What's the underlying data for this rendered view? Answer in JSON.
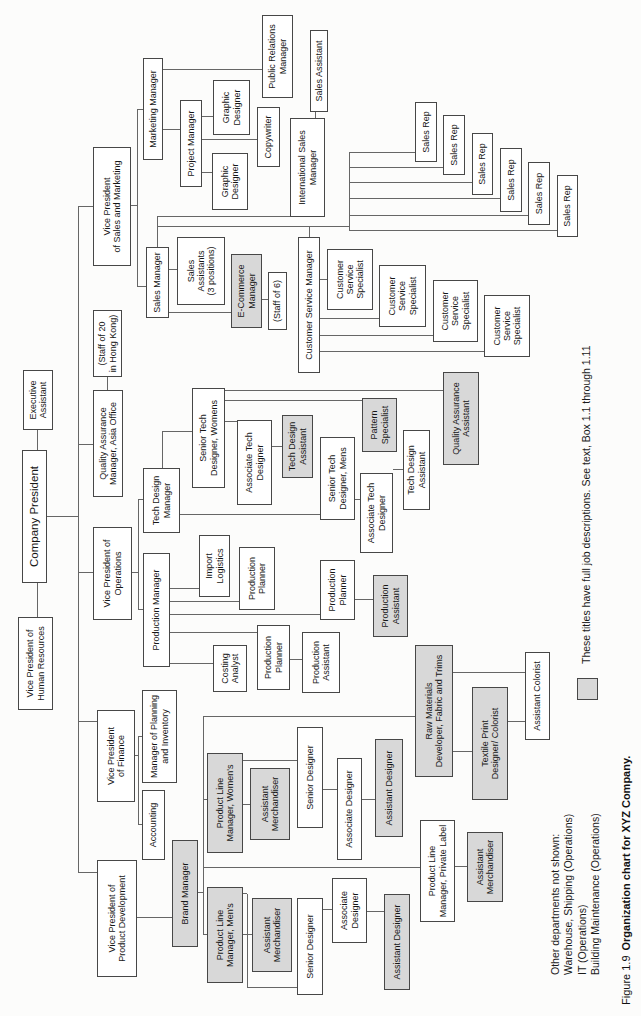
{
  "figure": {
    "caption_prefix": "Figure 1.9",
    "caption_title": "Organization chart for XYZ Company.",
    "legend": "These titles have full job descriptions. See text, Box 1.1 through 1.11",
    "notes": [
      "Other departments not shown:",
      "Warehouse, Shipping (Operations)",
      "IT (Operations)",
      "Building Maintenance (Operations)"
    ]
  },
  "colors": {
    "shaded_fill": "#d8d8d8",
    "box_border": "#474747",
    "connector": "#666666",
    "background": "#fcfcfb",
    "text": "#161616"
  },
  "nodes": [
    {
      "id": "vp-human-resources",
      "label": "Vice President of\nHuman Resources",
      "x": 306,
      "y": 18,
      "w": 93,
      "h": 35
    },
    {
      "id": "company-president",
      "label": "Company President",
      "x": 433,
      "y": 22,
      "w": 133,
      "h": 25,
      "big": true
    },
    {
      "id": "executive-assistant",
      "label": "Executive\nAssistant",
      "x": 586,
      "y": 23,
      "w": 60,
      "h": 30
    },
    {
      "id": "vp-product-development",
      "label": "Vice President of\nProduct Development",
      "x": 39,
      "y": 97,
      "w": 117,
      "h": 40
    },
    {
      "id": "vp-finance",
      "label": "Vice President\nof Finance",
      "x": 214,
      "y": 97,
      "w": 92,
      "h": 38
    },
    {
      "id": "vp-operations",
      "label": "Vice President of\nOperations",
      "x": 396,
      "y": 93,
      "w": 93,
      "h": 39
    },
    {
      "id": "qa-manager-asia-office",
      "label": "Quality Assurance\nManager, Asia Office",
      "x": 519,
      "y": 93,
      "w": 107,
      "h": 30
    },
    {
      "id": "staff-of-20",
      "label": "(Staff of 20\nin Hong Kong)",
      "x": 639,
      "y": 93,
      "w": 67,
      "h": 29
    },
    {
      "id": "vp-sales-marketing",
      "label": "Vice President\nof Sales and Marketing",
      "x": 750,
      "y": 93,
      "w": 119,
      "h": 38
    },
    {
      "id": "marketing-manager",
      "label": "Marketing Manager",
      "x": 856,
      "y": 143,
      "w": 102,
      "h": 20
    },
    {
      "id": "project-manager",
      "label": "Project Manager",
      "x": 829,
      "y": 180,
      "w": 87,
      "h": 22
    },
    {
      "id": "graphic-designer-1",
      "label": "Graphic\nDesigner",
      "x": 806,
      "y": 212,
      "w": 57,
      "h": 36
    },
    {
      "id": "graphic-designer-2",
      "label": "Graphic\nDesigner",
      "x": 881,
      "y": 213,
      "w": 55,
      "h": 37
    },
    {
      "id": "copywriter",
      "label": "Copywriter",
      "x": 849,
      "y": 257,
      "w": 60,
      "h": 23
    },
    {
      "id": "public-relations-manager",
      "label": "Public Relations\nManager",
      "x": 918,
      "y": 262,
      "w": 83,
      "h": 31
    },
    {
      "id": "sales-manager",
      "label": "Sales Manager",
      "x": 698,
      "y": 146,
      "w": 71,
      "h": 23
    },
    {
      "id": "sales-assistants",
      "label": "Sales\nAssistants\n(3 positions)",
      "x": 711,
      "y": 177,
      "w": 68,
      "h": 48
    },
    {
      "id": "e-commerce-manager",
      "label": "E-Commerce\nManager",
      "x": 688,
      "y": 231,
      "w": 74,
      "h": 31,
      "shaded": true
    },
    {
      "id": "staff-of-6",
      "label": "(Staff of 6)",
      "x": 686,
      "y": 268,
      "w": 58,
      "h": 19
    },
    {
      "id": "international-sales-manager",
      "label": "International Sales\nManager",
      "x": 799,
      "y": 290,
      "w": 99,
      "h": 35
    },
    {
      "id": "sales-assistant",
      "label": "Sales Assistant",
      "x": 904,
      "y": 310,
      "w": 82,
      "h": 18
    },
    {
      "id": "customer-service-manager",
      "label": "Customer Service Manager",
      "x": 643,
      "y": 298,
      "w": 136,
      "h": 22
    },
    {
      "id": "customer-service-specialist-1",
      "label": "Customer\nService\nSpecialist",
      "x": 706,
      "y": 327,
      "w": 61,
      "h": 46
    },
    {
      "id": "customer-service-specialist-2",
      "label": "Customer\nService\nSpecialist",
      "x": 689,
      "y": 379,
      "w": 62,
      "h": 47
    },
    {
      "id": "customer-service-specialist-3",
      "label": "Customer\nService\nSpecialist",
      "x": 674,
      "y": 433,
      "w": 62,
      "h": 45
    },
    {
      "id": "customer-service-specialist-4",
      "label": "Customer\nService\nSpecialist",
      "x": 659,
      "y": 484,
      "w": 62,
      "h": 46
    },
    {
      "id": "sales-rep-1",
      "label": "Sales Rep",
      "x": 854,
      "y": 415,
      "w": 60,
      "h": 22
    },
    {
      "id": "sales-rep-2",
      "label": "Sales Rep",
      "x": 841,
      "y": 443,
      "w": 60,
      "h": 22
    },
    {
      "id": "sales-rep-3",
      "label": "Sales Rep",
      "x": 821,
      "y": 472,
      "w": 62,
      "h": 21
    },
    {
      "id": "sales-rep-4",
      "label": "Sales Rep",
      "x": 804,
      "y": 500,
      "w": 64,
      "h": 22
    },
    {
      "id": "sales-rep-5",
      "label": "Sales Rep",
      "x": 791,
      "y": 528,
      "w": 63,
      "h": 22
    },
    {
      "id": "sales-rep-6",
      "label": "Sales Rep",
      "x": 779,
      "y": 557,
      "w": 62,
      "h": 21
    },
    {
      "id": "tech-design-manager",
      "label": "Tech Design\nManager",
      "x": 483,
      "y": 143,
      "w": 65,
      "h": 37
    },
    {
      "id": "senior-tech-designer-womens",
      "label": "Senior Tech\nDesigner, Womens",
      "x": 528,
      "y": 192,
      "w": 100,
      "h": 33
    },
    {
      "id": "associate-tech-designer-1",
      "label": "Associate Tech\nDesigner",
      "x": 511,
      "y": 237,
      "w": 85,
      "h": 35
    },
    {
      "id": "tech-design-assistant-1",
      "label": "Tech Design\nAssistant",
      "x": 538,
      "y": 282,
      "w": 63,
      "h": 31,
      "shaded": true
    },
    {
      "id": "senior-tech-designer-mens",
      "label": "Senior Tech\nDesigner, Mens",
      "x": 496,
      "y": 320,
      "w": 83,
      "h": 35
    },
    {
      "id": "associate-tech-designer-2",
      "label": "Associate Tech\nDesigner",
      "x": 463,
      "y": 360,
      "w": 80,
      "h": 33
    },
    {
      "id": "tech-design-assistant-2",
      "label": "Tech Design\nAssistant",
      "x": 506,
      "y": 403,
      "w": 80,
      "h": 27
    },
    {
      "id": "pattern-specialist",
      "label": "Pattern\nSpecialist",
      "x": 564,
      "y": 362,
      "w": 54,
      "h": 35,
      "shaded": true
    },
    {
      "id": "quality-assurance-assistant",
      "label": "Quality Assurance\nAssistant",
      "x": 551,
      "y": 443,
      "w": 93,
      "h": 36,
      "shaded": true
    },
    {
      "id": "production-manager",
      "label": "Production Manager",
      "x": 349,
      "y": 143,
      "w": 114,
      "h": 27
    },
    {
      "id": "import-logistics",
      "label": "Import\nLogistics",
      "x": 419,
      "y": 199,
      "w": 62,
      "h": 31
    },
    {
      "id": "production-planner-1",
      "label": "Production\nPlanner",
      "x": 406,
      "y": 239,
      "w": 63,
      "h": 36
    },
    {
      "id": "production-planner-2",
      "label": "Production\nPlanner",
      "x": 396,
      "y": 320,
      "w": 60,
      "h": 35
    },
    {
      "id": "production-assistant-1",
      "label": "Production\nAssistant",
      "x": 379,
      "y": 373,
      "w": 62,
      "h": 35,
      "shaded": true
    },
    {
      "id": "costing-analyst",
      "label": "Costing\nAnalyst",
      "x": 324,
      "y": 213,
      "w": 47,
      "h": 34
    },
    {
      "id": "production-planner-3",
      "label": "Production\nPlanner",
      "x": 326,
      "y": 257,
      "w": 65,
      "h": 33
    },
    {
      "id": "production-assistant-2",
      "label": "Production\nAssistant",
      "x": 323,
      "y": 302,
      "w": 61,
      "h": 38
    },
    {
      "id": "manager-planning-inventory",
      "label": "Manager of Planning\nand Inventory",
      "x": 233,
      "y": 142,
      "w": 93,
      "h": 35
    },
    {
      "id": "accounting",
      "label": "Accounting",
      "x": 156,
      "y": 142,
      "w": 70,
      "h": 23
    },
    {
      "id": "brand-manager",
      "label": "Brand Manager",
      "x": 69,
      "y": 172,
      "w": 107,
      "h": 26,
      "shaded": true
    },
    {
      "id": "product-line-manager-womens",
      "label": "Product Line\nManager, Women's",
      "x": 163,
      "y": 207,
      "w": 100,
      "h": 36,
      "shaded": true
    },
    {
      "id": "product-line-manager-mens",
      "label": "Product Line\nManager, Men's",
      "x": 33,
      "y": 207,
      "w": 96,
      "h": 36,
      "shaded": true
    },
    {
      "id": "product-line-manager-private-label",
      "label": "Product Line\nManager, Private Label",
      "x": 94,
      "y": 420,
      "w": 102,
      "h": 35
    },
    {
      "id": "assistant-merchandiser-womens",
      "label": "Assistant\nMerchandiser",
      "x": 176,
      "y": 250,
      "w": 72,
      "h": 40,
      "shaded": true
    },
    {
      "id": "assistant-merchandiser-mens",
      "label": "Assistant\nMerchandiser",
      "x": 44,
      "y": 252,
      "w": 74,
      "h": 40,
      "shaded": true
    },
    {
      "id": "assistant-merchandiser-private-label",
      "label": "Assistant\nMerchandiser",
      "x": 114,
      "y": 467,
      "w": 70,
      "h": 36,
      "shaded": true
    },
    {
      "id": "senior-designer-womens",
      "label": "Senior Designer",
      "x": 188,
      "y": 297,
      "w": 101,
      "h": 26
    },
    {
      "id": "associate-designer-womens",
      "label": "Associate Designer",
      "x": 156,
      "y": 337,
      "w": 102,
      "h": 25
    },
    {
      "id": "assistant-designer-womens",
      "label": "Assistant Designer",
      "x": 179,
      "y": 375,
      "w": 98,
      "h": 28,
      "shaded": true
    },
    {
      "id": "senior-designer-mens",
      "label": "Senior Designer",
      "x": 21,
      "y": 297,
      "w": 97,
      "h": 26
    },
    {
      "id": "associate-designer-mens",
      "label": "Associate\nDesigner",
      "x": 73,
      "y": 332,
      "w": 65,
      "h": 35
    },
    {
      "id": "assistant-designer-mens",
      "label": "Assistant Designer",
      "x": 26,
      "y": 384,
      "w": 96,
      "h": 26,
      "shaded": true
    },
    {
      "id": "raw-materials-developer",
      "label": "Raw Materials\nDeveloper, Fabric and Trims",
      "x": 239,
      "y": 415,
      "w": 132,
      "h": 38,
      "shaded": true
    },
    {
      "id": "textile-print-designer-colorist",
      "label": "Textile Print\nDesigner/ Colorist",
      "x": 216,
      "y": 472,
      "w": 113,
      "h": 36,
      "shaded": true
    },
    {
      "id": "assistant-colorist",
      "label": "Assistant Colorist",
      "x": 276,
      "y": 525,
      "w": 88,
      "h": 25
    },
    {
      "id": "legend-swatch",
      "label": "",
      "x": 316,
      "y": 577,
      "w": 22,
      "h": 21,
      "shaded": true
    }
  ],
  "lines": [
    [
      "h",
      399,
      37,
      34
    ],
    [
      "h",
      566,
      37,
      20
    ],
    [
      "v",
      499,
      47,
      31
    ],
    [
      "h",
      143,
      78,
      666
    ],
    [
      "v",
      143,
      78,
      19
    ],
    [
      "v",
      294,
      78,
      19
    ],
    [
      "v",
      443,
      78,
      15
    ],
    [
      "v",
      571,
      78,
      15
    ],
    [
      "v",
      809,
      78,
      15
    ],
    [
      "h",
      626,
      107,
      13
    ],
    [
      "v",
      810,
      131,
      6
    ],
    [
      "h",
      729,
      137,
      177
    ],
    [
      "v",
      906,
      137,
      6
    ],
    [
      "v",
      729,
      137,
      9
    ],
    [
      "v",
      886,
      163,
      17
    ],
    [
      "v",
      946,
      163,
      99
    ],
    [
      "v",
      843,
      202,
      10
    ],
    [
      "v",
      899,
      202,
      11
    ],
    [
      "v",
      876,
      202,
      55
    ],
    [
      "h",
      769,
      157,
      30
    ],
    [
      "v",
      799,
      157,
      133
    ],
    [
      "v",
      789,
      157,
      192
    ],
    [
      "h",
      779,
      309,
      10
    ],
    [
      "h",
      785,
      349,
      78
    ],
    [
      "v",
      863,
      349,
      66
    ],
    [
      "v",
      848,
      349,
      94
    ],
    [
      "v",
      833,
      349,
      123
    ],
    [
      "v",
      817,
      349,
      151
    ],
    [
      "v",
      800,
      349,
      179
    ],
    [
      "v",
      785,
      349,
      208
    ],
    [
      "v",
      746,
      169,
      8
    ],
    [
      "v",
      703,
      169,
      62
    ],
    [
      "v",
      716,
      262,
      6
    ],
    [
      "h",
      898,
      315,
      6
    ],
    [
      "v",
      736,
      320,
      7
    ],
    [
      "v",
      697,
      320,
      59
    ],
    [
      "v",
      680,
      320,
      113
    ],
    [
      "v",
      664,
      320,
      164
    ],
    [
      "v",
      443,
      132,
      6
    ],
    [
      "h",
      406,
      138,
      110
    ],
    [
      "v",
      516,
      138,
      5
    ],
    [
      "v",
      406,
      138,
      5
    ],
    [
      "h",
      548,
      162,
      36
    ],
    [
      "v",
      584,
      162,
      30
    ],
    [
      "v",
      501,
      180,
      140
    ],
    [
      "v",
      594,
      225,
      12
    ],
    [
      "v",
      569,
      272,
      10
    ],
    [
      "v",
      615,
      225,
      137
    ],
    [
      "v",
      625,
      225,
      218
    ],
    [
      "v",
      516,
      355,
      5
    ],
    [
      "v",
      546,
      393,
      10
    ],
    [
      "v",
      427,
      170,
      29
    ],
    [
      "v",
      414,
      170,
      69
    ],
    [
      "v",
      401,
      170,
      150
    ],
    [
      "v",
      383,
      170,
      87
    ],
    [
      "v",
      352,
      170,
      43
    ],
    [
      "v",
      416,
      355,
      18
    ],
    [
      "v",
      356,
      290,
      12
    ],
    [
      "v",
      260,
      135,
      3
    ],
    [
      "h",
      191,
      138,
      88
    ],
    [
      "v",
      279,
      138,
      4
    ],
    [
      "v",
      191,
      138,
      4
    ],
    [
      "v",
      98,
      137,
      35
    ],
    [
      "v",
      123,
      198,
      5
    ],
    [
      "h",
      81,
      203,
      218
    ],
    [
      "v",
      216,
      203,
      4
    ],
    [
      "v",
      81,
      203,
      4
    ],
    [
      "v",
      299,
      203,
      212
    ],
    [
      "v",
      148,
      203,
      217
    ],
    [
      "v",
      211,
      243,
      7
    ],
    [
      "v",
      255,
      243,
      54
    ],
    [
      "v",
      226,
      323,
      14
    ],
    [
      "v",
      216,
      362,
      13
    ],
    [
      "v",
      81,
      243,
      9
    ],
    [
      "v",
      122,
      243,
      4
    ],
    [
      "h",
      28,
      247,
      94
    ],
    [
      "v",
      28,
      247,
      50
    ],
    [
      "v",
      106,
      323,
      9
    ],
    [
      "v",
      104,
      367,
      17
    ],
    [
      "v",
      149,
      455,
      12
    ],
    [
      "v",
      264,
      453,
      19
    ],
    [
      "v",
      294,
      508,
      17
    ],
    [
      "v",
      343,
      453,
      72
    ]
  ]
}
